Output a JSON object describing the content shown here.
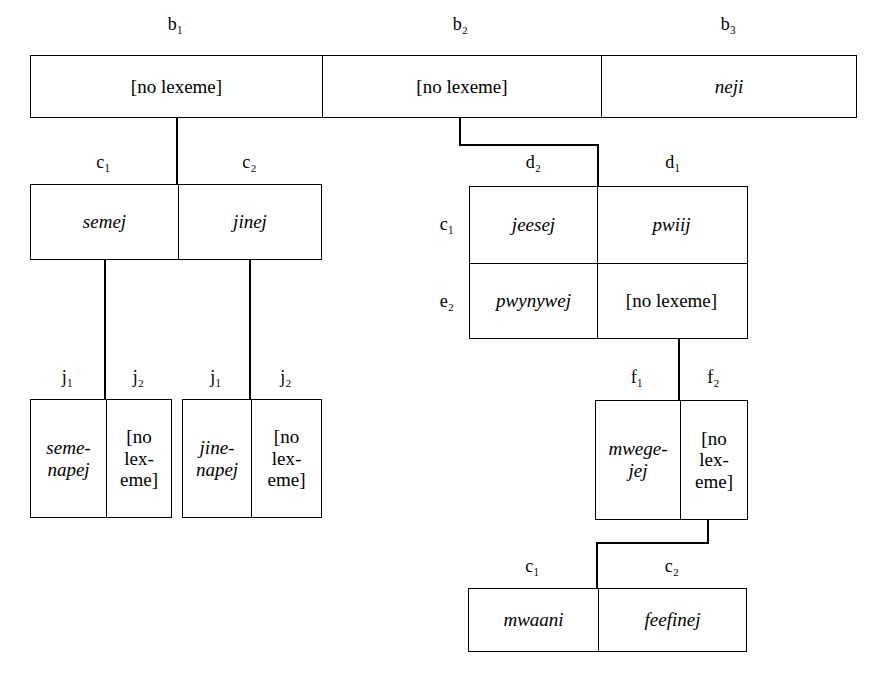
{
  "diagram": {
    "rows": {
      "top": {
        "labels": [
          "b₁",
          "b₂",
          "b₃"
        ],
        "cells": [
          {
            "text": "[no lexeme]",
            "style": "upright"
          },
          {
            "text": "[no lexeme]",
            "style": "upright"
          },
          {
            "text": "neji",
            "style": "italic"
          }
        ]
      },
      "left_c": {
        "labels": [
          "c₁",
          "c₂"
        ],
        "cells": [
          {
            "text": "semej",
            "style": "italic"
          },
          {
            "text": "jinej",
            "style": "italic"
          }
        ]
      },
      "d_grid": {
        "col_labels": [
          "d₂",
          "d₁"
        ],
        "row_labels": [
          "c₁",
          "e₂"
        ],
        "cells": [
          [
            {
              "text": "jeesej",
              "style": "italic"
            },
            {
              "text": "pwiij",
              "style": "italic"
            }
          ],
          [
            {
              "text": "pwynywej",
              "style": "italic"
            },
            {
              "text": "[no lexeme]",
              "style": "upright"
            }
          ]
        ]
      },
      "j_box_1": {
        "labels": [
          "j₁",
          "j₂"
        ],
        "cells": [
          {
            "line1": "seme-",
            "line2": "napej",
            "style": "italic"
          },
          {
            "line1": "[no",
            "line2": "lex-",
            "line3": "eme]",
            "style": "upright"
          }
        ]
      },
      "j_box_2": {
        "labels": [
          "j₁",
          "j₂"
        ],
        "cells": [
          {
            "line1": "jine-",
            "line2": "napej",
            "style": "italic"
          },
          {
            "line1": "[no",
            "line2": "lex-",
            "line3": "eme]",
            "style": "upright"
          }
        ]
      },
      "f_box": {
        "labels": [
          "f₁",
          "f₂"
        ],
        "cells": [
          {
            "line1": "mwege-",
            "line2": "jej",
            "style": "italic"
          },
          {
            "line1": "[no",
            "line2": "lex-",
            "line3": "eme]",
            "style": "upright"
          }
        ]
      },
      "bottom_c": {
        "labels": [
          "c₁",
          "c₂"
        ],
        "cells": [
          {
            "text": "mwaani",
            "style": "italic"
          },
          {
            "text": "feefinej",
            "style": "italic"
          }
        ]
      }
    },
    "colors": {
      "background": "#ffffff",
      "ink": "#000000"
    }
  }
}
